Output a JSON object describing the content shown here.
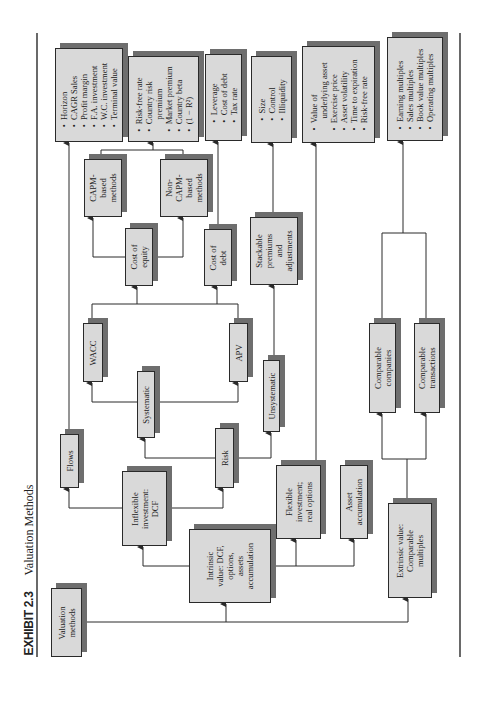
{
  "header": {
    "exhibit": "EXHIBIT 2.3",
    "title": "Valuation Methods"
  },
  "colors": {
    "box_fill": "#d9d9d9",
    "box_border": "#2a2a2a",
    "shadow": "#6e6e6e",
    "line": "#2a2a2a"
  },
  "nodes": {
    "valuation_methods": [
      "Valuation",
      "methods"
    ],
    "intrinsic": [
      "Intrinsic",
      "value: DCF,",
      "options,",
      "assets",
      "accumulation"
    ],
    "extrinsic": [
      "Extrinsic value:",
      "Comparable",
      "multiples"
    ],
    "inflexible": [
      "Inflexible",
      "investment:",
      "DCF"
    ],
    "flexible": [
      "Flexible",
      "investment;",
      "real options"
    ],
    "asset_accumulation": [
      "Asset",
      "accumulation"
    ],
    "flows": [
      "Flows"
    ],
    "risk": [
      "Risk"
    ],
    "systematic": [
      "Systematic"
    ],
    "unsystematic": [
      "Unsystematic"
    ],
    "wacc": [
      "WACC"
    ],
    "apv": [
      "APV"
    ],
    "cost_of_equity": [
      "Cost of",
      "equity"
    ],
    "cost_of_debt": [
      "Cost of",
      "debt"
    ],
    "capm": [
      "CAPM-",
      "based",
      "methods"
    ],
    "non_capm": [
      "Non-",
      "CAPM-",
      "based",
      "methods"
    ],
    "stackable": [
      "Stackable",
      "premiums",
      "and",
      "adjustments"
    ],
    "comparable_companies": [
      "Comparable",
      "companies"
    ],
    "comparable_transactions": [
      "Comparable",
      "transactions"
    ]
  },
  "lists": {
    "flows_inputs": [
      "Horizon",
      "CAGR Sales",
      "Profit margin",
      "F.A. investment",
      "W.C. investment",
      "Terminal value"
    ],
    "equity_inputs": [
      "Risk-free rate",
      "Country risk",
      "premium",
      "Market premium",
      "Country beta",
      "(1 − R²)"
    ],
    "debt_inputs": [
      "Leverage",
      "Cost of debt",
      "Tax rate"
    ],
    "premium_inputs": [
      "Size",
      "Control",
      "Illiquidity"
    ],
    "option_inputs": [
      "Value of",
      "underlying asset",
      "Exercise price",
      "Asset volatility",
      "Time to expiration",
      "Risk-free rate"
    ],
    "multiples": [
      "Earning multiples",
      "Sales multiples",
      "Book value multiples",
      "Operating multiples"
    ]
  }
}
